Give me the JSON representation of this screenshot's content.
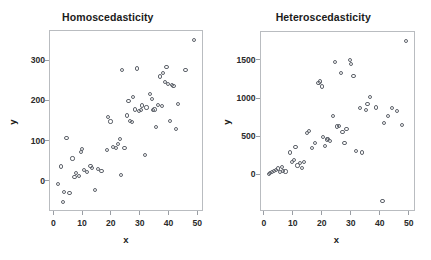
{
  "figure": {
    "background_color": "#ffffff",
    "marker_color": "#5e636b",
    "frame_color": "#b9bcc0",
    "text_color": "#1b1b1b"
  },
  "panels": [
    {
      "id": "homoscedasticity",
      "title": "Homoscedasticity",
      "xlabel": "x",
      "ylabel": "y"
    },
    {
      "id": "heteroscedasticity",
      "title": "Heteroscedasticity",
      "xlabel": "x",
      "ylabel": "y"
    }
  ],
  "chart_data": [
    {
      "type": "scatter",
      "title": "Homoscedasticity",
      "xlabel": "x",
      "ylabel": "y",
      "xlim": [
        -1.5,
        52
      ],
      "ylim": [
        -75,
        375
      ],
      "xticks": [
        0,
        10,
        20,
        30,
        40,
        50
      ],
      "yticks": [
        0,
        100,
        200,
        300
      ],
      "grid": false,
      "legend": null,
      "marker": "open-circle",
      "description": "Residual-style scatter with roughly constant vertical spread as x increases",
      "points": [
        [
          1.4,
          -5
        ],
        [
          2.2,
          38
        ],
        [
          3.0,
          -50
        ],
        [
          3.4,
          -25
        ],
        [
          4.2,
          108
        ],
        [
          5.3,
          -27
        ],
        [
          6.3,
          58
        ],
        [
          7.0,
          12
        ],
        [
          7.4,
          22
        ],
        [
          8.5,
          14
        ],
        [
          9.2,
          75
        ],
        [
          9.6,
          82
        ],
        [
          10.4,
          30
        ],
        [
          11.3,
          25
        ],
        [
          12.6,
          40
        ],
        [
          13.0,
          35
        ],
        [
          14.2,
          -21
        ],
        [
          15.1,
          32
        ],
        [
          16.4,
          27
        ],
        [
          18.2,
          80
        ],
        [
          18.6,
          162
        ],
        [
          19.5,
          150
        ],
        [
          20.4,
          86
        ],
        [
          21.3,
          84
        ],
        [
          22.1,
          95
        ],
        [
          22.8,
          107
        ],
        [
          23.1,
          16
        ],
        [
          23.6,
          278
        ],
        [
          24.4,
          85
        ],
        [
          25.3,
          165
        ],
        [
          25.8,
          200
        ],
        [
          26.4,
          152
        ],
        [
          27.0,
          148
        ],
        [
          27.4,
          210
        ],
        [
          28.1,
          180
        ],
        [
          28.6,
          282
        ],
        [
          29.4,
          176
        ],
        [
          30.2,
          178
        ],
        [
          30.6,
          190
        ],
        [
          31.5,
          66
        ],
        [
          32.0,
          185
        ],
        [
          33.3,
          218
        ],
        [
          33.8,
          205
        ],
        [
          34.2,
          178
        ],
        [
          34.8,
          180
        ],
        [
          35.4,
          136
        ],
        [
          36.1,
          192
        ],
        [
          36.8,
          262
        ],
        [
          37.3,
          188
        ],
        [
          37.8,
          270
        ],
        [
          38.4,
          248
        ],
        [
          39.0,
          286
        ],
        [
          39.6,
          244
        ],
        [
          40.2,
          152
        ],
        [
          40.8,
          240
        ],
        [
          41.4,
          238
        ],
        [
          42.2,
          131
        ],
        [
          43.0,
          194
        ],
        [
          45.6,
          278
        ],
        [
          48.6,
          352
        ]
      ]
    },
    {
      "type": "scatter",
      "title": "Heteroscedasticity",
      "xlabel": "x",
      "ylabel": "y",
      "xlim": [
        -1.5,
        52
      ],
      "ylim": [
        -480,
        1880
      ],
      "xticks": [
        0,
        10,
        20,
        30,
        40,
        50
      ],
      "yticks": [
        0,
        500,
        1000,
        1500
      ],
      "grid": false,
      "legend": null,
      "marker": "open-circle",
      "description": "Scatter showing fanning (increasing) vertical spread as x increases",
      "points": [
        [
          1.3,
          20
        ],
        [
          1.9,
          30
        ],
        [
          2.6,
          45
        ],
        [
          3.2,
          55
        ],
        [
          3.9,
          70
        ],
        [
          4.5,
          90
        ],
        [
          5.1,
          40
        ],
        [
          5.8,
          110
        ],
        [
          6.4,
          60
        ],
        [
          7.1,
          50
        ],
        [
          8.6,
          300
        ],
        [
          9.4,
          180
        ],
        [
          10.0,
          205
        ],
        [
          10.6,
          370
        ],
        [
          11.3,
          130
        ],
        [
          12.2,
          160
        ],
        [
          12.8,
          100
        ],
        [
          13.4,
          180
        ],
        [
          14.6,
          560
        ],
        [
          15.3,
          580
        ],
        [
          16.2,
          360
        ],
        [
          17.4,
          420
        ],
        [
          18.5,
          1210
        ],
        [
          19.0,
          1230
        ],
        [
          19.6,
          1165
        ],
        [
          20.2,
          500
        ],
        [
          20.8,
          390
        ],
        [
          21.4,
          470
        ],
        [
          21.9,
          480
        ],
        [
          22.6,
          455
        ],
        [
          23.4,
          780
        ],
        [
          24.1,
          1485
        ],
        [
          25.0,
          640
        ],
        [
          25.5,
          645
        ],
        [
          26.2,
          1340
        ],
        [
          26.8,
          570
        ],
        [
          27.5,
          425
        ],
        [
          28.2,
          610
        ],
        [
          29.4,
          1510
        ],
        [
          29.8,
          1465
        ],
        [
          30.6,
          1305
        ],
        [
          31.4,
          320
        ],
        [
          32.8,
          880
        ],
        [
          33.6,
          300
        ],
        [
          34.8,
          860
        ],
        [
          35.4,
          935
        ],
        [
          36.3,
          1025
        ],
        [
          38.5,
          890
        ],
        [
          40.6,
          -340
        ],
        [
          41.2,
          690
        ],
        [
          42.4,
          775
        ],
        [
          43.8,
          880
        ],
        [
          45.6,
          840
        ],
        [
          47.4,
          660
        ],
        [
          48.8,
          1760
        ]
      ]
    }
  ]
}
